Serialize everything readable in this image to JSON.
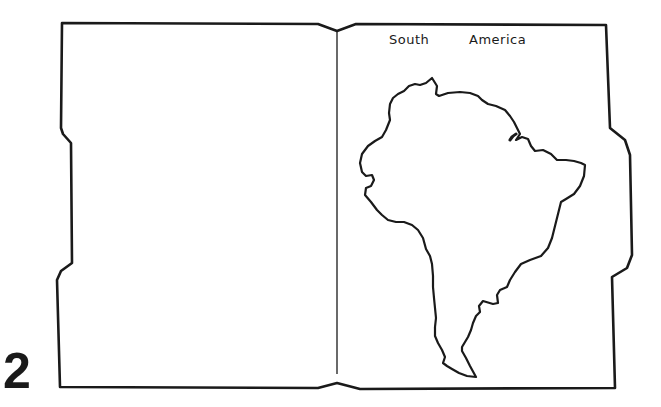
{
  "page": {
    "number": "2"
  },
  "map": {
    "title_words": [
      "South",
      "America"
    ],
    "title": "South America",
    "subject": "continent-outline"
  },
  "colors": {
    "ink": "#1a1a1a",
    "paper": "#ffffff"
  }
}
